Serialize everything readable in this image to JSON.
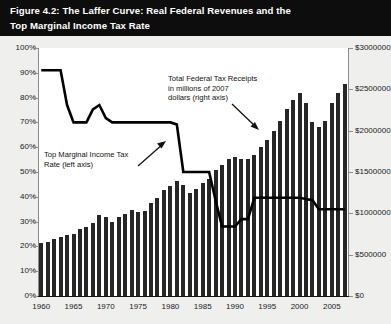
{
  "figure": {
    "title_line1": "Figure 4.2: The Laffer Curve: Real Federal Revenues and the",
    "title_line2": "Top Marginal Income Tax Rate"
  },
  "annotations": {
    "tax_rate": {
      "line1": "Top Marginal Income Tax",
      "line2": "Rate (left axis)"
    },
    "receipts": {
      "line1": "Total Federal Tax Receipts",
      "line2": "in millions of 2007",
      "line3": "dollars (right axis)"
    }
  },
  "colors": {
    "header_bg": "#0d0d0d",
    "header_text": "#ffffff",
    "page_bg": "#efefee",
    "plot_bg": "#ffffff",
    "bar": "#262626",
    "line": "#000000",
    "axis": "#8d8d8d"
  },
  "axis": {
    "left_ticks": [
      "0%",
      "10%",
      "20%",
      "30%",
      "40%",
      "50%",
      "60%",
      "70%",
      "80%",
      "90%",
      "100%"
    ],
    "right_ticks": [
      "$0",
      "$500000",
      "$1000000",
      "$1500000",
      "$2000000",
      "$2500000",
      "$3000000"
    ],
    "x_ticks": [
      "1960",
      "1965",
      "1970",
      "1975",
      "1980",
      "1985",
      "1990",
      "1995",
      "2000",
      "2005"
    ]
  },
  "chart_data": {
    "type": "bar",
    "title": "Figure 4.2: The Laffer Curve: Real Federal Revenues and the Top Marginal Income Tax Rate",
    "xlabel": "",
    "ylabel": "Top Marginal Income Tax Rate (left axis)",
    "y2label": "Total Federal Tax Receipts in millions of 2007 dollars (right axis)",
    "xlim": [
      1960,
      2007
    ],
    "ylim": [
      0,
      100
    ],
    "y2lim": [
      0,
      3000000
    ],
    "ytick_labels": [
      "0%",
      "10%",
      "20%",
      "30%",
      "40%",
      "50%",
      "60%",
      "70%",
      "80%",
      "90%",
      "100%"
    ],
    "y2tick_labels": [
      "$0",
      "$500000",
      "$1000000",
      "$1500000",
      "$2000000",
      "$2500000",
      "$3000000"
    ],
    "xtick_labels": [
      "1960",
      "1965",
      "1970",
      "1975",
      "1980",
      "1985",
      "1990",
      "1995",
      "2000",
      "2005"
    ],
    "grid": false,
    "legend": "none (inline annotations with leader arrows)",
    "x": [
      1960,
      1961,
      1962,
      1963,
      1964,
      1965,
      1966,
      1967,
      1968,
      1969,
      1970,
      1971,
      1972,
      1973,
      1974,
      1975,
      1976,
      1977,
      1978,
      1979,
      1980,
      1981,
      1982,
      1983,
      1984,
      1985,
      1986,
      1987,
      1988,
      1989,
      1990,
      1991,
      1992,
      1993,
      1994,
      1995,
      1996,
      1997,
      1998,
      1999,
      2000,
      2001,
      2002,
      2003,
      2004,
      2005,
      2006,
      2007
    ],
    "series": [
      {
        "name": "Total Federal Tax Receipts (millions of 2007 dollars, right axis)",
        "axis": "right",
        "type": "bar",
        "values": [
          640000,
          650000,
          685000,
          710000,
          735000,
          745000,
          815000,
          840000,
          885000,
          975000,
          950000,
          900000,
          950000,
          990000,
          1040000,
          1020000,
          1030000,
          1120000,
          1190000,
          1280000,
          1330000,
          1390000,
          1340000,
          1250000,
          1300000,
          1370000,
          1410000,
          1530000,
          1580000,
          1660000,
          1680000,
          1660000,
          1660000,
          1700000,
          1800000,
          1890000,
          2000000,
          2120000,
          2260000,
          2370000,
          2450000,
          2340000,
          2110000,
          2040000,
          2120000,
          2330000,
          2450000,
          2570000
        ]
      },
      {
        "name": "Top Marginal Income Tax Rate (left axis)",
        "axis": "left",
        "type": "line",
        "values": [
          91,
          91,
          91,
          91,
          77,
          70,
          70,
          70,
          75.25,
          77,
          71.75,
          70,
          70,
          70,
          70,
          70,
          70,
          70,
          70,
          70,
          70,
          69.125,
          50,
          50,
          50,
          50,
          50,
          38.5,
          28,
          28,
          28,
          31,
          31,
          39.6,
          39.6,
          39.6,
          39.6,
          39.6,
          39.6,
          39.6,
          39.6,
          39.1,
          38.6,
          35,
          35,
          35,
          35,
          35
        ]
      }
    ]
  }
}
